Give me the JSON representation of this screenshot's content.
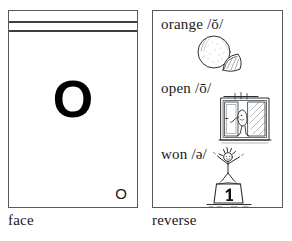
{
  "figure": {
    "title": "Phonics flashcard for the letter O, face and reverse"
  },
  "face_card": {
    "big_letter": "O",
    "corner_letter": "O",
    "rule_lines": 2,
    "caption": "face"
  },
  "reverse_card": {
    "caption": "reverse",
    "entries": [
      {
        "word": "orange",
        "phoneme": "/ŏ/",
        "text": "orange /ŏ/",
        "illustration": "orange-fruit-with-wedge-icon",
        "illustration_description": "A whole orange with a cut wedge beside it"
      },
      {
        "word": "open",
        "phoneme": "/ō/",
        "text": "open /ō/",
        "illustration": "person-opening-window-icon",
        "illustration_description": "A child opening a casement window"
      },
      {
        "word": "won",
        "phoneme": "/ə/",
        "text": "won /ə/",
        "illustration": "winner-on-podium-icon",
        "illustration_description": "A stick figure with arms raised standing on a podium numbered 1"
      }
    ]
  },
  "colors": {
    "ink": "#16191c",
    "card_border": "#555a5e",
    "rule_line": "#3a3f43",
    "page_background": "#ffffff",
    "letter_fill": "#000000"
  }
}
